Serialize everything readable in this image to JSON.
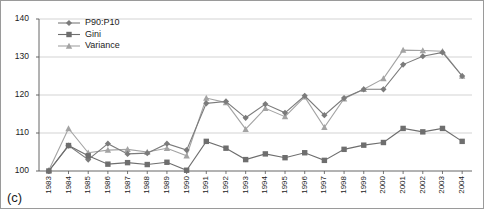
{
  "figure": {
    "panel_label": "(c)",
    "background": "#ffffff",
    "border_color": "#9a9a9a"
  },
  "legend": {
    "position": "top-left-inside",
    "entries": [
      {
        "label": "P90:P10",
        "marker": "diamond",
        "color": "#7b7b7b"
      },
      {
        "label": "Gini",
        "marker": "square",
        "color": "#6e6e6e"
      },
      {
        "label": "Variance",
        "marker": "triangle",
        "color": "#a3a3a3"
      }
    ]
  },
  "chart_data": {
    "type": "line",
    "title": "",
    "subtitle": "",
    "xlabel": "",
    "ylabel": "",
    "grid": true,
    "gridlines_y": [
      110,
      120,
      130,
      140
    ],
    "ylim": [
      100,
      140
    ],
    "yticks": [
      100,
      110,
      120,
      130,
      140
    ],
    "ytick_labels": [
      "100",
      "110",
      "120",
      "130",
      "140"
    ],
    "x": [
      1983,
      1984,
      1985,
      1986,
      1987,
      1988,
      1989,
      1990,
      1991,
      1992,
      1993,
      1994,
      1995,
      1996,
      1997,
      1998,
      1999,
      2000,
      2001,
      2002,
      2003,
      2004
    ],
    "xtick_labels": [
      "1983",
      "1984",
      "1985",
      "1986",
      "1987",
      "1988",
      "1989",
      "1990",
      "1991",
      "1992",
      "1993",
      "1994",
      "1995",
      "1996",
      "1997",
      "1998",
      "1999",
      "2000",
      "2001",
      "2002",
      "2003",
      "2004"
    ],
    "series": [
      {
        "name": "P90:P10",
        "marker": "diamond",
        "color": "#7b7b7b",
        "values": [
          100.0,
          106.7,
          103.0,
          107.2,
          104.5,
          104.7,
          107.2,
          105.5,
          117.8,
          118.3,
          114.0,
          117.6,
          115.3,
          119.8,
          114.7,
          119.2,
          121.5,
          121.5,
          128.0,
          130.2,
          131.2,
          125.0
        ]
      },
      {
        "name": "Gini",
        "marker": "square",
        "color": "#6e6e6e",
        "values": [
          100.0,
          106.7,
          104.0,
          101.8,
          102.2,
          101.7,
          102.3,
          100.2,
          107.8,
          106.0,
          103.0,
          104.5,
          103.5,
          104.8,
          102.8,
          105.7,
          106.8,
          107.5,
          111.2,
          110.3,
          111.2,
          107.8
        ]
      },
      {
        "name": "Variance",
        "marker": "triangle",
        "color": "#a3a3a3",
        "values": [
          100.2,
          111.2,
          104.8,
          105.5,
          105.7,
          105.0,
          106.0,
          104.0,
          119.2,
          118.0,
          111.0,
          116.5,
          114.3,
          119.5,
          111.5,
          119.0,
          121.5,
          124.3,
          131.8,
          131.7,
          131.5,
          125.0
        ]
      }
    ]
  }
}
